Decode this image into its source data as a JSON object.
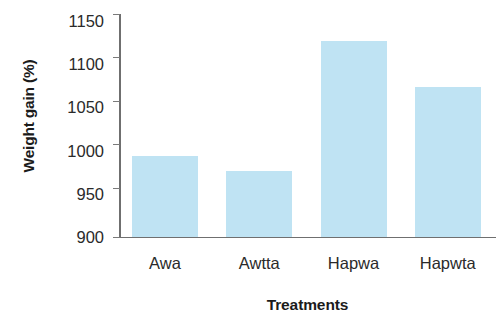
{
  "chart_data": {
    "type": "bar",
    "title": "",
    "subtitle": "",
    "xlabel": "Treatments",
    "ylabel": "Weight gain (%)",
    "categories": [
      "Awa",
      "Awtta",
      "Hapwa",
      "Hapwta"
    ],
    "values": [
      990,
      973,
      1118,
      1067
    ],
    "series": [
      {
        "name": "Weight gain",
        "values": [
          990,
          973,
          1118,
          1067
        ],
        "color": "#bfe3f3"
      }
    ],
    "ylim": [
      900,
      1150
    ],
    "xlim": [
      0,
      4
    ],
    "yticks": [
      900,
      950,
      1000,
      1050,
      1100,
      1150
    ],
    "ytick_labels": [
      "900",
      "950",
      "1000",
      "1050",
      "1100",
      "1150"
    ],
    "grid": false,
    "legend": false,
    "legend_position": "none",
    "annotations": []
  },
  "axis": {
    "y_title": "Weight gain (%)",
    "x_title": "Treatments",
    "axis_color": "#6f6f6f",
    "tick_color": "#7a7a7a",
    "label_color": "#2a2a2a"
  }
}
